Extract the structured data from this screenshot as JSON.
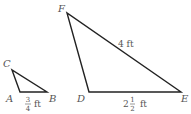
{
  "diagram": {
    "type": "similar-triangles",
    "triangles": [
      {
        "name": "small-triangle",
        "vertices": [
          {
            "label": "A",
            "x": 20,
            "y": 92,
            "label_x": 5,
            "label_y": 102
          },
          {
            "label": "B",
            "x": 47,
            "y": 92,
            "label_x": 49,
            "label_y": 102
          },
          {
            "label": "C",
            "x": 12,
            "y": 70,
            "label_x": 3,
            "label_y": 67
          }
        ],
        "measurements": [
          {
            "side": "AB",
            "whole": "",
            "numerator": "3",
            "denominator": "4",
            "unit": "ft"
          }
        ]
      },
      {
        "name": "large-triangle",
        "vertices": [
          {
            "label": "D",
            "x": 89,
            "y": 92,
            "label_x": 76,
            "label_y": 102
          },
          {
            "label": "E",
            "x": 181,
            "y": 92,
            "label_x": 181,
            "label_y": 102
          },
          {
            "label": "F",
            "x": 67,
            "y": 13,
            "label_x": 58,
            "label_y": 12
          }
        ],
        "measurements": [
          {
            "side": "FE",
            "text": "4 ft"
          },
          {
            "side": "DE",
            "whole": "2",
            "numerator": "1",
            "denominator": "2",
            "unit": "ft"
          }
        ]
      }
    ]
  }
}
